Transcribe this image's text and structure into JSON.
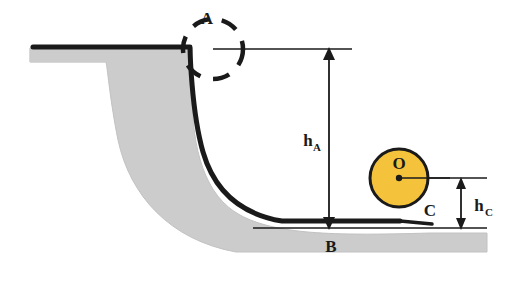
{
  "figure": {
    "name": "ramp-and-ball-physics-diagram",
    "background_color": "#ffffff",
    "ground_fill": "#cccccc",
    "ground_stroke": "#b3b3b3",
    "ramp_color": "#1a1a1a",
    "ball_fill": "#f5c33b",
    "ball_stroke": "#1a1a1a",
    "dashed_circle_color": "#1a1a1a"
  },
  "labels": {
    "point_a": "A",
    "point_b": "B",
    "point_c": "C",
    "point_o": "O",
    "height_a_main": "h",
    "height_a_sub": "A",
    "height_c_main": "h",
    "height_c_sub": "C"
  }
}
